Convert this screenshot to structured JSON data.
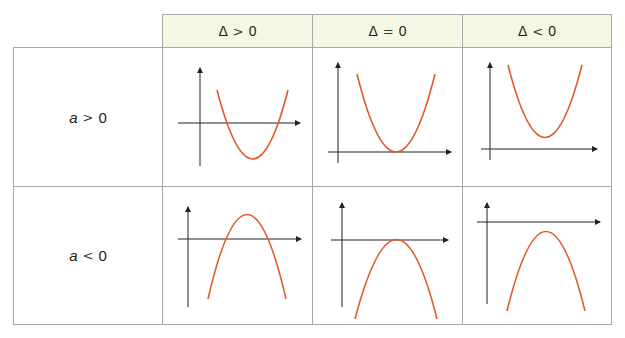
{
  "table": {
    "columns": [
      {
        "delta_symbol": "Δ",
        "relation": ">",
        "value": "0"
      },
      {
        "delta_symbol": "Δ",
        "relation": "=",
        "value": "0"
      },
      {
        "delta_symbol": "Δ",
        "relation": "<",
        "value": "0"
      }
    ],
    "rows": [
      {
        "var": "a",
        "relation": ">",
        "value": "0"
      },
      {
        "var": "a",
        "relation": "<",
        "value": "0"
      }
    ]
  },
  "colors": {
    "header_bg": "#f4f7e3",
    "curve": "#e4592c",
    "axis": "#222222",
    "border": "#a8a8a8"
  }
}
